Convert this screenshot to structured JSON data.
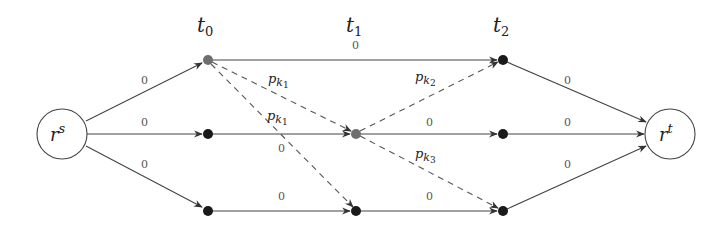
{
  "diagram": {
    "type": "layered flow network",
    "columns": [
      {
        "id": "t0",
        "label_base": "t",
        "label_sub": "0",
        "x": 208
      },
      {
        "id": "t1",
        "label_base": "t",
        "label_sub": "1",
        "x": 356
      },
      {
        "id": "t2",
        "label_base": "t",
        "label_sub": "2",
        "x": 503
      }
    ],
    "terminals": {
      "source": {
        "base": "r",
        "sup": "s"
      },
      "sink": {
        "base": "r",
        "sup": "t"
      }
    },
    "nodes": [
      {
        "id": "rs",
        "kind": "terminal"
      },
      {
        "id": "a0",
        "column": "t0",
        "row": 0,
        "color": "#6e6e6e"
      },
      {
        "id": "b0",
        "column": "t0",
        "row": 1,
        "color": "#1a1a1a"
      },
      {
        "id": "c0",
        "column": "t0",
        "row": 2,
        "color": "#1a1a1a"
      },
      {
        "id": "b1",
        "column": "t1",
        "row": 1,
        "color": "#6e6e6e"
      },
      {
        "id": "c1",
        "column": "t1",
        "row": 2,
        "color": "#1a1a1a"
      },
      {
        "id": "a2",
        "column": "t2",
        "row": 0,
        "color": "#1a1a1a"
      },
      {
        "id": "b2",
        "column": "t2",
        "row": 1,
        "color": "#1a1a1a"
      },
      {
        "id": "c2",
        "column": "t2",
        "row": 2,
        "color": "#1a1a1a"
      },
      {
        "id": "rt",
        "kind": "terminal"
      }
    ],
    "edge_labels": {
      "rs_a0": "0",
      "rs_b0": "0",
      "rs_c0": "0",
      "a0_a2": "0",
      "b0_b1": "0",
      "c0_c1": "0",
      "b1_b2": "0",
      "c1_c2": "0",
      "a2_rt": "0",
      "b2_rt": "0",
      "c2_rt": "0",
      "a0_b1": {
        "base": "p",
        "sub": "k",
        "subsub": "1"
      },
      "a0_c1": "0",
      "a0_c1_upper": {
        "base": "p",
        "sub": "k",
        "subsub": "1"
      },
      "b1_a2": {
        "base": "p",
        "sub": "k",
        "subsub": "2"
      },
      "b1_c2": {
        "base": "p",
        "sub": "k",
        "subsub": "3"
      }
    },
    "colors": {
      "edge": "#444444",
      "highlight_node": "#6e6e6e",
      "node": "#1a1a1a"
    }
  }
}
